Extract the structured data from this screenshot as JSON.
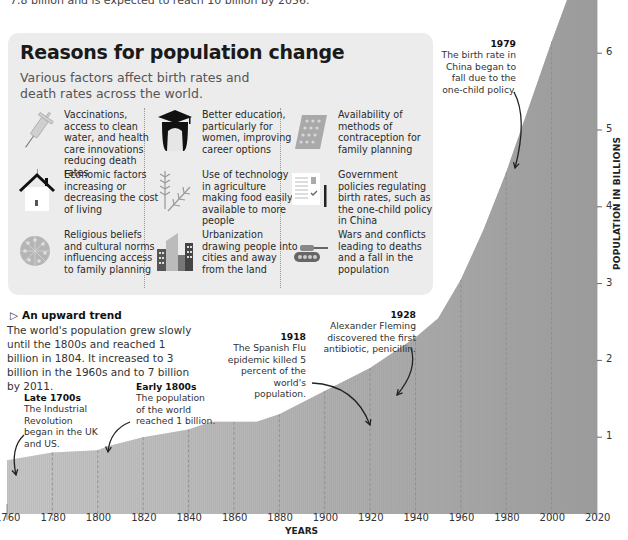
{
  "intro_text": "7.8 billion and is expected to reach 10 billion by 2056.",
  "panel": {
    "title": "Reasons for population change",
    "subtitle": "Various factors affect birth rates and death rates across the world.",
    "reasons": [
      {
        "icon": "syringe-icon",
        "text": "Vaccinations, access to clean water, and health care innovations reducing death rates"
      },
      {
        "icon": "graduate-icon",
        "text": "Better education, particularly for women, improving career options"
      },
      {
        "icon": "contraceptive-pills-icon",
        "text": "Availability of methods of contraception for family planning"
      },
      {
        "icon": "house-icon",
        "text": "Economic factors increasing or decreasing the cost of living"
      },
      {
        "icon": "wheat-icon",
        "text": "Use of technology in agriculture making food easily available to more people"
      },
      {
        "icon": "policy-document-icon",
        "text": "Government policies regulating birth rates, such as the one-child policy in China"
      },
      {
        "icon": "religion-wheel-icon",
        "text": "Religious beliefs and cultural norms influencing access to family planning"
      },
      {
        "icon": "city-buildings-icon",
        "text": "Urbanization drawing people into cities and away from the land"
      },
      {
        "icon": "tank-icon",
        "text": "Wars and conflicts leading to deaths and a fall in the population"
      }
    ]
  },
  "trend": {
    "title": "An upward trend",
    "body": "The world's population grew slowly until the 1800s and reached 1 billion in 1804. It increased to 3 billion in the 1960s and to 7 billion by 2011."
  },
  "annotations": [
    {
      "year_label": "Late 1700s",
      "text": "The Industrial Revolution began in the UK and US."
    },
    {
      "year_label": "Early 1800s",
      "text": "The population of the world reached 1 billion."
    },
    {
      "year_label": "1918",
      "text": "The Spanish Flu epidemic killed 5 percent of the world's population."
    },
    {
      "year_label": "1928",
      "text": "Alexander Fleming discovered the first antibiotic, penicillin."
    },
    {
      "year_label": "1979",
      "text": "The birth rate in China began to fall due to the one-child policy."
    }
  ],
  "chart_data": {
    "type": "area",
    "xlabel": "YEARS",
    "ylabel": "POPULATION IN BILLIONS",
    "x_ticks": [
      1760,
      1780,
      1800,
      1820,
      1840,
      1860,
      1880,
      1900,
      1920,
      1940,
      1960,
      1980,
      2000,
      2020
    ],
    "y_ticks": [
      1,
      2,
      3,
      4,
      5,
      6
    ],
    "xlim": [
      1760,
      2020
    ],
    "ylim": [
      0,
      6.6
    ],
    "grid": "vertical dashed at x ticks",
    "series": [
      {
        "name": "World population (billions)",
        "x": [
          1760,
          1780,
          1800,
          1804,
          1820,
          1840,
          1850,
          1860,
          1870,
          1880,
          1900,
          1910,
          1920,
          1930,
          1940,
          1950,
          1960,
          1970,
          1980,
          1990,
          2000,
          2010,
          2011,
          2020
        ],
        "values": [
          0.7,
          0.8,
          0.83,
          0.88,
          1.0,
          1.1,
          1.2,
          1.2,
          1.2,
          1.3,
          1.6,
          1.75,
          1.9,
          2.1,
          2.3,
          2.55,
          3.05,
          3.7,
          4.45,
          5.3,
          6.15,
          6.95,
          7.0,
          7.8
        ]
      }
    ],
    "annotations": [
      {
        "x": 1762,
        "label": "Late 1700s"
      },
      {
        "x": 1806,
        "label": "Early 1800s"
      },
      {
        "x": 1918,
        "label": "1918"
      },
      {
        "x": 1928,
        "label": "1928"
      },
      {
        "x": 1979,
        "label": "1979"
      }
    ]
  }
}
